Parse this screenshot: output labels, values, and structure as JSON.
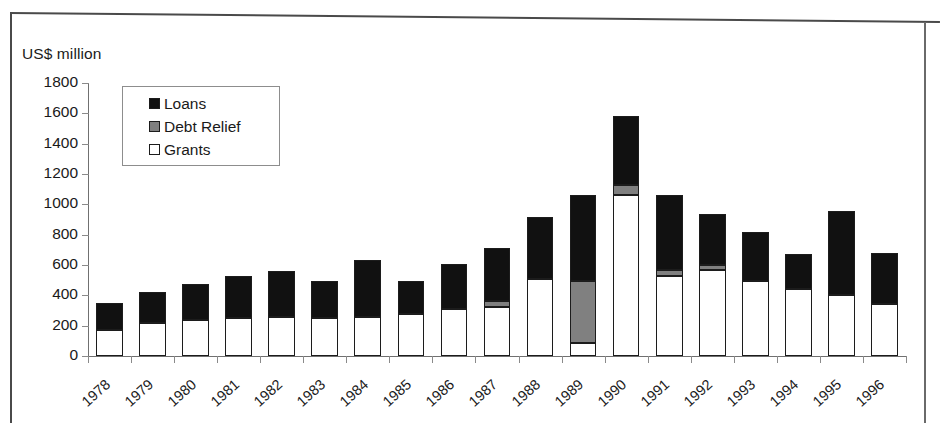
{
  "axis_title": "US$ million",
  "legend": {
    "items": [
      {
        "label": "Loans",
        "swatch": "black-square-icon",
        "color": "#111111"
      },
      {
        "label": "Debt Relief",
        "swatch": "gray-square-icon",
        "color": "#808080"
      },
      {
        "label": "Grants",
        "swatch": "white-square-icon",
        "color": "#ffffff"
      }
    ]
  },
  "chart_data": {
    "type": "bar",
    "stacked": true,
    "title": "",
    "subtitle": "",
    "xlabel": "",
    "ylabel": "US$ million",
    "ylim": [
      0,
      1800
    ],
    "ytick_step": 200,
    "yticks": [
      0,
      200,
      400,
      600,
      800,
      1000,
      1200,
      1400,
      1600,
      1800
    ],
    "grid": false,
    "legend_position": "top-left-inside",
    "categories": [
      "1978",
      "1979",
      "1980",
      "1981",
      "1982",
      "1983",
      "1984",
      "1985",
      "1986",
      "1987",
      "1988",
      "1989",
      "1990",
      "1991",
      "1992",
      "1993",
      "1994",
      "1995",
      "1996"
    ],
    "series": [
      {
        "name": "Grants",
        "color": "#ffffff",
        "values": [
          170,
          220,
          240,
          250,
          255,
          250,
          255,
          280,
          310,
          320,
          508,
          85,
          1060,
          525,
          570,
          495,
          440,
          405,
          340
        ]
      },
      {
        "name": "Debt Relief",
        "color": "#808080",
        "values": [
          0,
          0,
          0,
          0,
          0,
          0,
          0,
          0,
          0,
          45,
          0,
          410,
          70,
          40,
          30,
          0,
          0,
          0,
          0
        ]
      },
      {
        "name": "Loans",
        "color": "#111111",
        "values": [
          180,
          200,
          235,
          275,
          305,
          245,
          375,
          215,
          295,
          350,
          407,
          565,
          450,
          495,
          335,
          320,
          235,
          550,
          340
        ]
      }
    ],
    "totals": [
      350,
      420,
      475,
      525,
      560,
      495,
      630,
      495,
      605,
      715,
      915,
      1060,
      1580,
      1060,
      935,
      815,
      675,
      955,
      680
    ]
  }
}
